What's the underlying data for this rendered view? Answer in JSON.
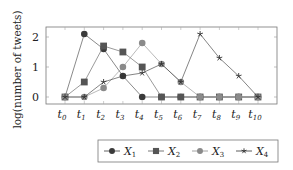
{
  "chart_data": {
    "type": "line",
    "title": "",
    "xlabel": "",
    "ylabel": "log(number of tweets)",
    "x": [
      "t0",
      "t1",
      "t2",
      "t3",
      "t4",
      "t5",
      "t6",
      "t7",
      "t8",
      "t9",
      "t10"
    ],
    "x_tick_labels": [
      {
        "base": "t",
        "sub": "0"
      },
      {
        "base": "t",
        "sub": "1"
      },
      {
        "base": "t",
        "sub": "2"
      },
      {
        "base": "t",
        "sub": "3"
      },
      {
        "base": "t",
        "sub": "4"
      },
      {
        "base": "t",
        "sub": "5"
      },
      {
        "base": "t",
        "sub": "6"
      },
      {
        "base": "t",
        "sub": "7"
      },
      {
        "base": "t",
        "sub": "8"
      },
      {
        "base": "t",
        "sub": "9"
      },
      {
        "base": "t",
        "sub": "10"
      }
    ],
    "y_ticks": [
      0,
      1,
      2
    ],
    "ylim": [
      -0.25,
      2.3
    ],
    "grid": false,
    "legend_position": "bottom",
    "series": [
      {
        "name": "X1",
        "base": "X",
        "sub": "1",
        "marker": "circle",
        "color": "#3a3a3a",
        "values": [
          0,
          2.1,
          1.6,
          0.7,
          0,
          0,
          0,
          0,
          0,
          0,
          0
        ]
      },
      {
        "name": "X2",
        "base": "X",
        "sub": "2",
        "marker": "square",
        "color": "#555555",
        "values": [
          0,
          0.5,
          1.7,
          1.5,
          1.0,
          0,
          0,
          0,
          0,
          0,
          0
        ]
      },
      {
        "name": "X3",
        "base": "X",
        "sub": "3",
        "marker": "circle",
        "color": "#8a8a8a",
        "values": [
          0,
          0,
          0.3,
          1.0,
          1.8,
          1.1,
          0.5,
          0,
          0,
          0,
          0
        ]
      },
      {
        "name": "X4",
        "base": "X",
        "sub": "4",
        "marker": "star",
        "color": "#333333",
        "values": [
          0,
          0,
          0.5,
          0.7,
          0.8,
          1.1,
          0.5,
          2.1,
          1.3,
          0.7,
          0
        ]
      }
    ]
  }
}
